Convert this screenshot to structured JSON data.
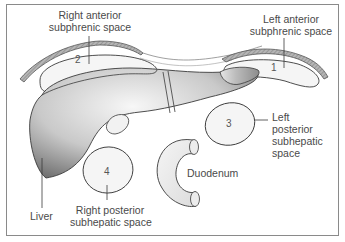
{
  "diagram": {
    "labels": {
      "right_anterior": [
        "Right anterior",
        "subphrenic space"
      ],
      "left_anterior": [
        "Left anterior",
        "subphrenic space"
      ],
      "left_posterior": [
        "Left",
        "posterior",
        "subhepatic",
        "space"
      ],
      "right_posterior": [
        "Right posterior",
        "subhepatic space"
      ],
      "duodenum": "Duodenum",
      "liver": "Liver"
    },
    "numbers": {
      "left_anterior": "1",
      "right_anterior": "2",
      "left_posterior": "3",
      "right_posterior": "4"
    },
    "colors": {
      "stroke": "#3a3a3a",
      "liver_dark": "#7a7a7a",
      "liver_light": "#f2f2f2",
      "space_fill": "#f4f4f4",
      "diaphragm": "#9a9a9a",
      "text": "#4a4a4a"
    }
  }
}
